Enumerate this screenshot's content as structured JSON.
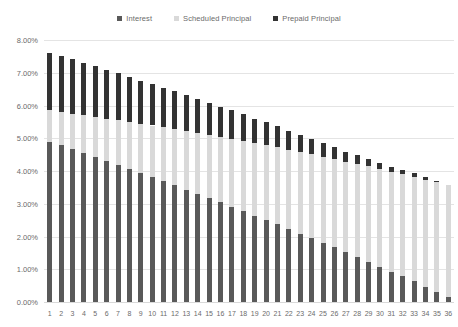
{
  "chart_data": {
    "type": "bar",
    "stacked": true,
    "title": "",
    "subtitle": "",
    "xlabel": "",
    "ylabel": "",
    "ylim": [
      0,
      0.08
    ],
    "ytick_values": [
      0,
      0.01,
      0.02,
      0.03,
      0.04,
      0.05,
      0.06,
      0.07,
      0.08
    ],
    "ytick_labels": [
      "0.00%",
      "1.00%",
      "2.00%",
      "3.00%",
      "4.00%",
      "5.00%",
      "6.00%",
      "7.00%",
      "8.00%"
    ],
    "grid": true,
    "grid_axis": "y",
    "legend_position": "top-center",
    "categories": [
      "1",
      "2",
      "3",
      "4",
      "5",
      "6",
      "7",
      "8",
      "9",
      "10",
      "11",
      "12",
      "13",
      "14",
      "15",
      "16",
      "17",
      "18",
      "19",
      "20",
      "21",
      "22",
      "23",
      "24",
      "25",
      "26",
      "27",
      "28",
      "29",
      "30",
      "31",
      "32",
      "33",
      "34",
      "35",
      "36"
    ],
    "series": [
      {
        "name": "Interest",
        "color": "#595959",
        "values": [
          4.9,
          4.78,
          4.66,
          4.54,
          4.42,
          4.3,
          4.18,
          4.06,
          3.93,
          3.81,
          3.68,
          3.56,
          3.43,
          3.3,
          3.17,
          3.04,
          2.91,
          2.78,
          2.64,
          2.51,
          2.37,
          2.23,
          2.09,
          1.95,
          1.81,
          1.67,
          1.52,
          1.38,
          1.23,
          1.08,
          0.93,
          0.78,
          0.63,
          0.47,
          0.32,
          0.16
        ]
      },
      {
        "name": "Scheduled Principal",
        "color": "#d9d9d9",
        "values": [
          0.95,
          1.02,
          1.09,
          1.16,
          1.23,
          1.3,
          1.37,
          1.44,
          1.51,
          1.58,
          1.65,
          1.72,
          1.79,
          1.86,
          1.93,
          2.0,
          2.07,
          2.14,
          2.21,
          2.28,
          2.35,
          2.42,
          2.49,
          2.56,
          2.63,
          2.7,
          2.77,
          2.84,
          2.91,
          2.98,
          3.05,
          3.12,
          3.19,
          3.26,
          3.33,
          3.4
        ]
      },
      {
        "name": "Prepaid Principal",
        "color": "#333333",
        "values": [
          1.75,
          1.72,
          1.66,
          1.6,
          1.55,
          1.49,
          1.43,
          1.38,
          1.32,
          1.26,
          1.21,
          1.15,
          1.09,
          1.04,
          0.98,
          0.92,
          0.87,
          0.81,
          0.75,
          0.7,
          0.64,
          0.58,
          0.53,
          0.47,
          0.41,
          0.36,
          0.3,
          0.26,
          0.22,
          0.18,
          0.15,
          0.13,
          0.11,
          0.09,
          0.06,
          0.0
        ]
      }
    ],
    "value_unit": "percent"
  },
  "legend": {
    "items": [
      {
        "label": "Interest",
        "color": "#595959",
        "marker": "square-marker"
      },
      {
        "label": "Scheduled Principal",
        "color": "#d9d9d9",
        "marker": "square-marker"
      },
      {
        "label": "Prepaid Principal",
        "color": "#333333",
        "marker": "square-marker"
      }
    ]
  },
  "colors": {
    "background": "#ffffff",
    "gridline": "#e4e4e4",
    "axis_text": "#6b6b6b",
    "interest": "#595959",
    "scheduled_principal": "#d9d9d9",
    "prepaid_principal": "#333333"
  }
}
